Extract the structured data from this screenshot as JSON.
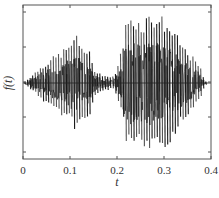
{
  "chart_data": {
    "type": "line",
    "title": "",
    "xlabel": "t",
    "ylabel": "f(t)",
    "xlim": [
      0,
      0.4
    ],
    "ylim": [
      -1.2,
      1.2
    ],
    "x_ticks": [
      "0",
      "0.1",
      "0.2",
      "0.3",
      "0.4"
    ],
    "y_ticks_labeled": false,
    "y_tick_count": 5,
    "grid": false,
    "legend": null,
    "envelope": {
      "t": [
        0,
        0.01,
        0.02,
        0.04,
        0.06,
        0.08,
        0.1,
        0.11,
        0.12,
        0.13,
        0.14,
        0.15,
        0.16,
        0.17,
        0.18,
        0.19,
        0.2,
        0.21,
        0.22,
        0.23,
        0.24,
        0.25,
        0.26,
        0.27,
        0.28,
        0.29,
        0.3,
        0.31,
        0.32,
        0.33,
        0.34,
        0.35,
        0.36,
        0.37,
        0.38,
        0.385,
        0.39
      ],
      "amplitude": [
        0,
        0.06,
        0.12,
        0.25,
        0.35,
        0.45,
        0.55,
        0.72,
        0.58,
        0.52,
        0.48,
        0.22,
        0.15,
        0.12,
        0.1,
        0.08,
        0.2,
        0.5,
        0.9,
        1.0,
        0.95,
        0.9,
        0.95,
        1.0,
        1.0,
        0.98,
        0.92,
        0.85,
        0.75,
        0.65,
        0.55,
        0.45,
        0.38,
        0.3,
        0.18,
        0.06,
        0.02
      ]
    },
    "oscillation_period": 0.0055
  },
  "colors": {
    "signal": "#1a1a1a",
    "axes": "#555555"
  }
}
